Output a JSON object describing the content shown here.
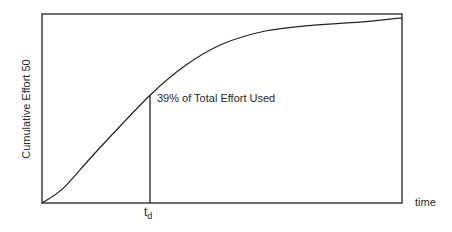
{
  "chart_data": {
    "type": "line",
    "title": "",
    "xlabel": "time",
    "ylabel": "Cumulative Effort 50",
    "grid": false,
    "legend": null,
    "series": [
      {
        "name": "Cumulative Effort",
        "description": "S-shaped cumulative effort curve rising from origin and flattening toward total effort",
        "x": [
          0,
          0.06,
          0.15,
          0.3,
          0.4,
          0.5,
          0.62,
          0.75,
          0.9,
          1.0
        ],
        "y": [
          0,
          0.08,
          0.27,
          0.57,
          0.73,
          0.84,
          0.91,
          0.94,
          0.96,
          0.98
        ]
      }
    ],
    "markers": [
      {
        "type": "vertical-line",
        "x": 0.3,
        "label": "t_d",
        "y_at_curve": 0.57
      }
    ],
    "annotations": [
      {
        "text": "39% of Total Effort Used",
        "x": 0.32,
        "y": 0.57
      }
    ],
    "xticks": [
      {
        "value": 0.3,
        "label": "t_d"
      }
    ]
  },
  "labels": {
    "ylabel": "Cumulative Effort 50",
    "xlabel": "time",
    "annotation": "39% of Total Effort Used",
    "td_main": "t",
    "td_sub": "d"
  }
}
